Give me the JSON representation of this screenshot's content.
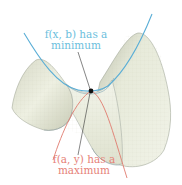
{
  "figure": {
    "colors": {
      "surface_fill": "#e9ecdc",
      "surface_shade": "#b9bca9",
      "surface_edge": "#8d9c96",
      "min_curve": "#5aaed6",
      "max_curve": "#e07a6e",
      "point": "#111111",
      "leader": "#333333"
    },
    "labels": {
      "minimum": {
        "line1": "f(x, b) has a",
        "line2": "minimum",
        "color": "#6cc0dd"
      },
      "maximum": {
        "line1": "f(a, y) has a",
        "line2": "maximum",
        "color": "#e68278"
      }
    },
    "saddle_point": {
      "x": 91,
      "y": 91
    }
  }
}
